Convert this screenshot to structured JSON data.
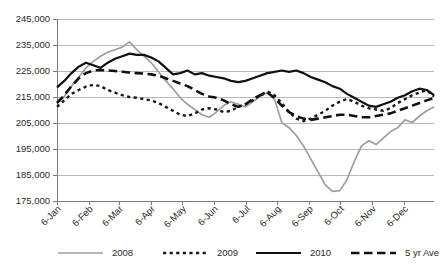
{
  "chart_data": {
    "type": "line",
    "title": "",
    "subtitle": "",
    "xlabel": "",
    "ylabel": "",
    "grid": true,
    "legend_position": "bottom",
    "ylim": [
      175000,
      245000
    ],
    "ytick_labels": [
      "245,000",
      "235,000",
      "225,000",
      "215,000",
      "205,000",
      "195,000",
      "185,000",
      "175,000"
    ],
    "yticks": [
      245000,
      235000,
      225000,
      215000,
      205000,
      195000,
      185000,
      175000
    ],
    "xtick_labels": [
      "6-Jan",
      "6-Feb",
      "6-Mar",
      "6-Apr",
      "6-May",
      "6-Jun",
      "6-Jul",
      "6-Aug",
      "6-Sep",
      "6-Oct",
      "6-Nov",
      "6-Dec"
    ],
    "x_unit": "week",
    "x_count": 53,
    "xtick_indices": [
      0,
      4.4,
      8.6,
      13.0,
      17.3,
      21.7,
      26.0,
      30.4,
      34.8,
      39.1,
      43.5,
      47.8
    ],
    "series": [
      {
        "name": "2008",
        "color": "#9e9e9e",
        "style": "solid",
        "width": 1.7,
        "values": [
          212500,
          215000,
          219000,
          222500,
          226000,
          228500,
          230500,
          232000,
          233000,
          234000,
          236000,
          233000,
          230500,
          228000,
          224500,
          221000,
          218000,
          214500,
          212000,
          210000,
          208000,
          207000,
          209000,
          211500,
          213000,
          212000,
          211000,
          213000,
          215000,
          216500,
          214000,
          205000,
          203000,
          200000,
          196000,
          191000,
          186000,
          181000,
          178500,
          178800,
          183000,
          190000,
          196000,
          198000,
          196500,
          199000,
          201500,
          203000,
          206000,
          205000,
          207500,
          209500,
          211000
        ]
      },
      {
        "name": "2009",
        "color": "#1a1a1a",
        "style": "dotted",
        "width": 2.4,
        "values": [
          211000,
          213500,
          216000,
          217500,
          218800,
          219500,
          219000,
          217500,
          216500,
          215500,
          214800,
          214500,
          214000,
          213500,
          212500,
          211000,
          209500,
          208000,
          207500,
          208500,
          210000,
          210500,
          210000,
          209000,
          209500,
          211000,
          212000,
          213500,
          215500,
          217000,
          215500,
          212500,
          209000,
          206500,
          205500,
          206500,
          208000,
          209500,
          211500,
          213000,
          214000,
          213000,
          211500,
          210500,
          210000,
          209500,
          210500,
          212500,
          214000,
          215500,
          216500,
          217500,
          215000
        ]
      },
      {
        "name": "2010",
        "color": "#111111",
        "style": "solid",
        "width": 2.2,
        "values": [
          218500,
          221000,
          224000,
          226500,
          228000,
          227000,
          226000,
          228000,
          229500,
          230500,
          231500,
          231000,
          231000,
          230000,
          228500,
          226000,
          223500,
          224000,
          225000,
          223500,
          224000,
          223000,
          222500,
          222000,
          221000,
          220500,
          221000,
          222000,
          223000,
          224000,
          224500,
          225000,
          224500,
          225000,
          224000,
          222500,
          221500,
          220500,
          219000,
          218000,
          216000,
          214500,
          213000,
          211500,
          211000,
          212000,
          213000,
          214500,
          215500,
          217000,
          218000,
          217500,
          215500
        ]
      },
      {
        "name": "5 yr Ave",
        "color": "#111111",
        "style": "dashed",
        "width": 2.6,
        "values": [
          212500,
          215500,
          219000,
          222000,
          224000,
          225000,
          225200,
          225000,
          224800,
          224500,
          224200,
          224000,
          223800,
          223500,
          223000,
          222000,
          221000,
          220000,
          219000,
          217500,
          216000,
          215000,
          214500,
          213500,
          212000,
          211000,
          212000,
          214000,
          215500,
          216500,
          214500,
          211500,
          209000,
          207500,
          206500,
          206000,
          206500,
          207000,
          207500,
          208000,
          208000,
          207500,
          207000,
          207000,
          207500,
          208000,
          208500,
          209500,
          210500,
          211500,
          212500,
          213500,
          214500
        ]
      }
    ]
  },
  "legend": {
    "items": [
      {
        "label": "2008"
      },
      {
        "label": "2009"
      },
      {
        "label": "2010"
      },
      {
        "label": "5 yr Ave"
      }
    ]
  }
}
